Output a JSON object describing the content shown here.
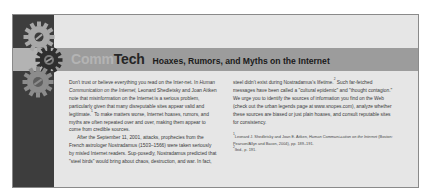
{
  "feature": {
    "brand_part1": "Comm",
    "brand_part2": "Tech",
    "headline": "Hoaxes, Rumors, and Myths on the Internet"
  },
  "colors": {
    "left_column": "#3d3d3d",
    "banner": "#9c9c9c",
    "panel_background": "#e6e6e6",
    "brand_light": "#b4b4b4",
    "brand_dark": "#262626"
  },
  "gears": [
    {
      "name": "top-gear",
      "color": "#a8a8a8"
    },
    {
      "name": "middle-gear",
      "color": "#2e2e2e"
    },
    {
      "name": "bottom-gear",
      "color": "#8c8c8c"
    }
  ],
  "body": {
    "left": {
      "p1_a": "Don't trust or believe everything you read on the Inter-net. In ",
      "p1_book": "Human Communication on the Internet,",
      "p1_b": " Leonard Shedletsky and Joan Aitken note that misinformation on the Internet is a serious problem, particularly given that many disreputable sites appear valid and legitimate.",
      "p1_ref": "1",
      "p1_c": " To make matters worse, Internet hoaxes, rumors, and myths are often repeated over and over, making them appear to come from credible sources.",
      "p2": "After the September 11, 2001, attacks, prophecies from the French astrologer Nostradamus (1503–1566) were taken seriously by misled Internet readers. Sup-posedly, Nostradamus predicted that \"steel birds\" would bring about chaos, destruction, and war. In fact,"
    },
    "right": {
      "p1_a": "steel didn't exist during Nostradamus's lifetime.",
      "p1_ref": "2",
      "p1_b": " Such far-fetched messages have been called a \"cultural epidemic\" and \"thought contagion.\" We urge you to identify the sources of information you find on the Web (check out the urban legends page at www.snopes.com), analyze whether these sources are biased or just plain hoaxes, and consult reputable sites for consistency."
    }
  },
  "footnotes": [
    {
      "ref": "1",
      "author": "Leonard J. Shedletsky and Joan E. Aitken, ",
      "title": "Human Communi-cation on the Internet",
      "rest": " (Boston: Pearson/Allyn and Bacon, 2004), pp. 189–191."
    },
    {
      "ref": "2",
      "text": "Ibid., p. 191."
    }
  ]
}
